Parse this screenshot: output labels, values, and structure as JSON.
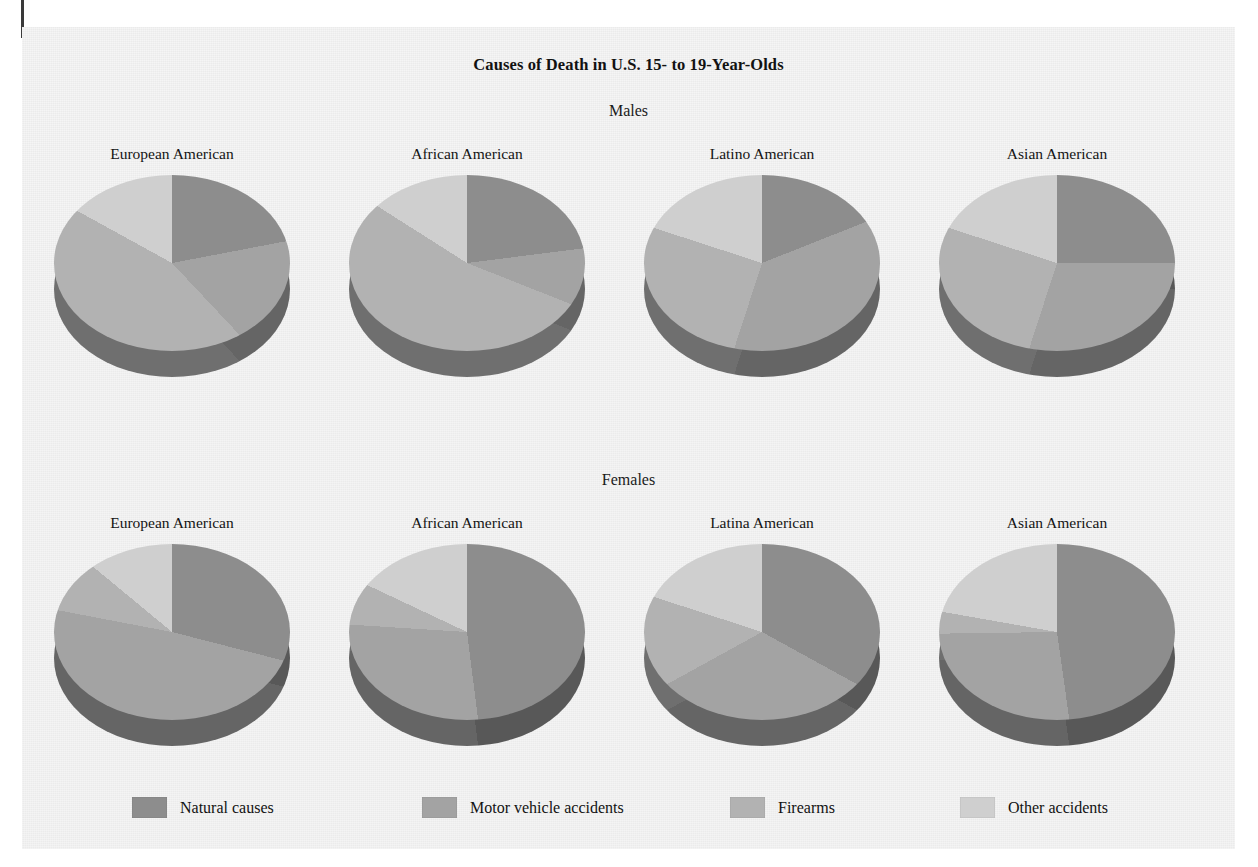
{
  "page": {
    "cut_off_text_top": "",
    "figure_title": "Causes of Death in U.S. 15- to 19-Year-Olds"
  },
  "sections": {
    "males_label": "Males",
    "females_label": "Females"
  },
  "legend": {
    "items": [
      {
        "label": "Natural causes",
        "color": "#8d8d8d"
      },
      {
        "label": "Motor vehicle accidents",
        "color": "#a3a3a3"
      },
      {
        "label": "Firearms",
        "color": "#b2b2b2"
      },
      {
        "label": "Other accidents",
        "color": "#cfcfcf"
      }
    ]
  },
  "chart_data": {
    "type": "pie",
    "title": "Causes of Death in U.S. 15- to 19-Year-Olds",
    "categories": [
      "Natural causes",
      "Motor vehicle accidents",
      "Firearms",
      "Other accidents"
    ],
    "colors": [
      "#8d8d8d",
      "#a3a3a3",
      "#b2b2b2",
      "#cfcfcf"
    ],
    "units": "percent",
    "panels": [
      {
        "group": "Males",
        "label": "European American",
        "values": [
          22,
          16,
          45,
          17
        ],
        "start_angle": 0
      },
      {
        "group": "Males",
        "label": "African American",
        "values": [
          23,
          8,
          53,
          16
        ],
        "start_angle": 0
      },
      {
        "group": "Males",
        "label": "Latino American",
        "values": [
          19,
          36,
          25,
          20
        ],
        "start_angle": 0
      },
      {
        "group": "Males",
        "label": "Asian American",
        "values": [
          25,
          30,
          25,
          20
        ],
        "start_angle": 0
      },
      {
        "group": "Females",
        "label": "European American",
        "values": [
          29,
          49,
          8,
          14
        ],
        "start_angle": 0
      },
      {
        "group": "Females",
        "label": "African American",
        "values": [
          48,
          28,
          6,
          18
        ],
        "start_angle": 0
      },
      {
        "group": "Females",
        "label": "Latina American",
        "values": [
          33,
          34,
          13,
          20
        ],
        "start_angle": 0
      },
      {
        "group": "Females",
        "label": "Asian American",
        "values": [
          40,
          27,
          3,
          30
        ],
        "start_angle": 28
      }
    ]
  }
}
